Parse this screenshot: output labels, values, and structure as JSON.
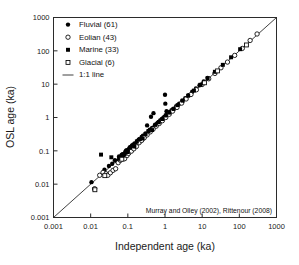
{
  "chart_data": {
    "type": "scatter",
    "title": "",
    "xlabel": "Independent age (ka)",
    "ylabel": "OSL age (ka)",
    "xscale": "log",
    "yscale": "log",
    "xlim": [
      0.001,
      1000
    ],
    "ylim": [
      0.001,
      1000
    ],
    "grid": false,
    "xticks": [
      "0.001",
      "0.01",
      "0.1",
      "1",
      "10",
      "100",
      "1000"
    ],
    "yticks": [
      "0.001",
      "0.01",
      "0.1",
      "1",
      "10",
      "100",
      "1000"
    ],
    "legend_position": "upper-left",
    "annotation": "Murray and Olley (2002), Rittenour (2008)",
    "reference_line": {
      "label": "1:1 line",
      "slope": 1,
      "from": [
        0.001,
        0.001
      ],
      "to": [
        1000,
        1000
      ]
    },
    "series": [
      {
        "name": "Fluvial",
        "count": 61,
        "marker": "filled-circle",
        "color": "#000000",
        "points": [
          [
            0.0105,
            0.0115
          ],
          [
            0.0125,
            0.0072
          ],
          [
            0.0235,
            0.027
          ],
          [
            0.031,
            0.035
          ],
          [
            0.038,
            0.041
          ],
          [
            0.045,
            0.052
          ],
          [
            0.052,
            0.049
          ],
          [
            0.058,
            0.068
          ],
          [
            0.062,
            0.058
          ],
          [
            0.068,
            0.075
          ],
          [
            0.072,
            0.079
          ],
          [
            0.079,
            0.071
          ],
          [
            0.085,
            0.093
          ],
          [
            0.092,
            0.105
          ],
          [
            0.099,
            0.088
          ],
          [
            0.108,
            0.118
          ],
          [
            0.118,
            0.132
          ],
          [
            0.128,
            0.115
          ],
          [
            0.138,
            0.152
          ],
          [
            0.152,
            0.168
          ],
          [
            0.165,
            0.148
          ],
          [
            0.178,
            0.195
          ],
          [
            0.195,
            0.215
          ],
          [
            0.215,
            0.192
          ],
          [
            0.235,
            0.26
          ],
          [
            0.255,
            0.285
          ],
          [
            0.275,
            0.25
          ],
          [
            0.3,
            0.33
          ],
          [
            0.33,
            0.58
          ],
          [
            0.36,
            0.395
          ],
          [
            0.39,
            0.43
          ],
          [
            0.42,
            1.05
          ],
          [
            0.45,
            0.49
          ],
          [
            0.49,
            1.35
          ],
          [
            0.53,
            0.58
          ],
          [
            0.58,
            0.63
          ],
          [
            0.63,
            0.69
          ],
          [
            0.68,
            0.74
          ],
          [
            0.74,
            0.81
          ],
          [
            0.81,
            0.88
          ],
          [
            0.88,
            0.96
          ],
          [
            0.95,
            1.04
          ],
          [
            1.0,
            4.8
          ],
          [
            1.02,
            2.6
          ],
          [
            1.05,
            1.15
          ],
          [
            1.1,
            1.55
          ],
          [
            1.15,
            1.25
          ],
          [
            1.25,
            1.38
          ],
          [
            1.35,
            1.48
          ],
          [
            1.5,
            1.65
          ],
          [
            1.7,
            1.85
          ],
          [
            2.0,
            2.2
          ],
          [
            2.4,
            2.6
          ],
          [
            2.9,
            3.2
          ],
          [
            3.5,
            3.8
          ],
          [
            4.3,
            4.7
          ],
          [
            5.4,
            5.9
          ],
          [
            6.8,
            7.4
          ],
          [
            8.5,
            9.3
          ],
          [
            11.0,
            12.0
          ],
          [
            14.0,
            15.5
          ]
        ]
      },
      {
        "name": "Eolian",
        "count": 43,
        "marker": "open-circle",
        "color": "#000000",
        "points": [
          [
            0.0128,
            0.0073
          ],
          [
            0.0175,
            0.0185
          ],
          [
            0.0215,
            0.0225
          ],
          [
            0.026,
            0.0205
          ],
          [
            0.029,
            0.0185
          ],
          [
            0.034,
            0.022
          ],
          [
            0.04,
            0.026
          ],
          [
            0.047,
            0.029
          ],
          [
            0.055,
            0.044
          ],
          [
            0.063,
            0.052
          ],
          [
            0.071,
            0.061
          ],
          [
            0.082,
            0.058
          ],
          [
            0.095,
            0.072
          ],
          [
            0.105,
            0.084
          ],
          [
            0.125,
            0.098
          ],
          [
            0.145,
            0.115
          ],
          [
            0.17,
            0.135
          ],
          [
            0.2,
            0.175
          ],
          [
            0.235,
            0.205
          ],
          [
            0.275,
            0.245
          ],
          [
            0.33,
            0.3
          ],
          [
            0.4,
            0.37
          ],
          [
            0.48,
            0.45
          ],
          [
            0.58,
            0.55
          ],
          [
            0.7,
            0.66
          ],
          [
            0.85,
            0.8
          ],
          [
            1.05,
            1.0
          ],
          [
            1.3,
            1.25
          ],
          [
            1.6,
            1.55
          ],
          [
            2.1,
            2.0
          ],
          [
            2.8,
            2.7
          ],
          [
            3.7,
            3.6
          ],
          [
            5.0,
            4.9
          ],
          [
            7.0,
            6.8
          ],
          [
            10.0,
            9.8
          ],
          [
            15.0,
            14.5
          ],
          [
            22.0,
            21.0
          ],
          [
            32.0,
            31.0
          ],
          [
            48.0,
            46.0
          ],
          [
            75.0,
            73.0
          ],
          [
            120.0,
            118.0
          ],
          [
            195.0,
            205.0
          ],
          [
            300.0,
            320.0
          ]
        ]
      },
      {
        "name": "Marine",
        "count": 33,
        "marker": "filled-square",
        "color": "#000000",
        "points": [
          [
            0.019,
            0.077
          ],
          [
            0.036,
            0.064
          ],
          [
            0.058,
            0.058
          ],
          [
            0.066,
            0.062
          ],
          [
            0.074,
            0.072
          ],
          [
            0.082,
            0.079
          ],
          [
            0.09,
            0.098
          ],
          [
            0.1,
            0.092
          ],
          [
            0.115,
            0.125
          ],
          [
            0.13,
            0.142
          ],
          [
            0.15,
            0.135
          ],
          [
            0.175,
            0.19
          ],
          [
            0.21,
            0.225
          ],
          [
            0.25,
            0.235
          ],
          [
            0.3,
            0.32
          ],
          [
            0.36,
            0.39
          ],
          [
            0.45,
            0.42
          ],
          [
            0.55,
            0.6
          ],
          [
            0.68,
            0.72
          ],
          [
            0.85,
            0.9
          ],
          [
            1.05,
            1.15
          ],
          [
            1.3,
            1.4
          ],
          [
            1.7,
            1.8
          ],
          [
            2.2,
            2.35
          ],
          [
            3.0,
            3.2
          ],
          [
            4.2,
            4.5
          ],
          [
            6.0,
            6.4
          ],
          [
            9.0,
            9.6
          ],
          [
            14.0,
            15.0
          ],
          [
            22.0,
            23.5
          ],
          [
            36.0,
            38.0
          ],
          [
            60.0,
            64.0
          ],
          [
            105.0,
            112.0
          ]
        ]
      },
      {
        "name": "Glacial",
        "count": 6,
        "marker": "open-square",
        "color": "#000000",
        "points": [
          [
            0.013,
            0.0068
          ],
          [
            0.024,
            0.018
          ],
          [
            0.069,
            0.056
          ],
          [
            11.5,
            11.0
          ],
          [
            26.0,
            25.0
          ],
          [
            155.0,
            150.0
          ]
        ]
      }
    ]
  },
  "legend": {
    "items": [
      {
        "label": "Fluvial (61)",
        "marker": "filled-circle"
      },
      {
        "label": "Eolian (43)",
        "marker": "open-circle"
      },
      {
        "label": "Marine (33)",
        "marker": "filled-square"
      },
      {
        "label": "Glacial (6)",
        "marker": "open-square"
      },
      {
        "label": "1:1 line",
        "marker": "line"
      }
    ]
  }
}
